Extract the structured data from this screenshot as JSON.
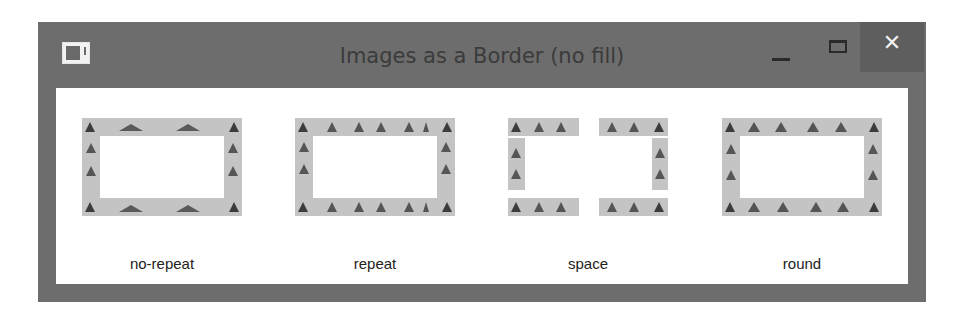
{
  "window": {
    "title": "Images as a Border (no fill)",
    "controls": {
      "minimize": "–",
      "maximize": "☐",
      "close": "✕"
    }
  },
  "demos": [
    {
      "label": "no-repeat"
    },
    {
      "label": "repeat"
    },
    {
      "label": "space"
    },
    {
      "label": "round"
    }
  ],
  "colors": {
    "titlebar": "#6d6d6d",
    "close_button": "#5e5e5e",
    "border_strip": "#c4c4c4",
    "triangle": "#3c3c3c"
  }
}
